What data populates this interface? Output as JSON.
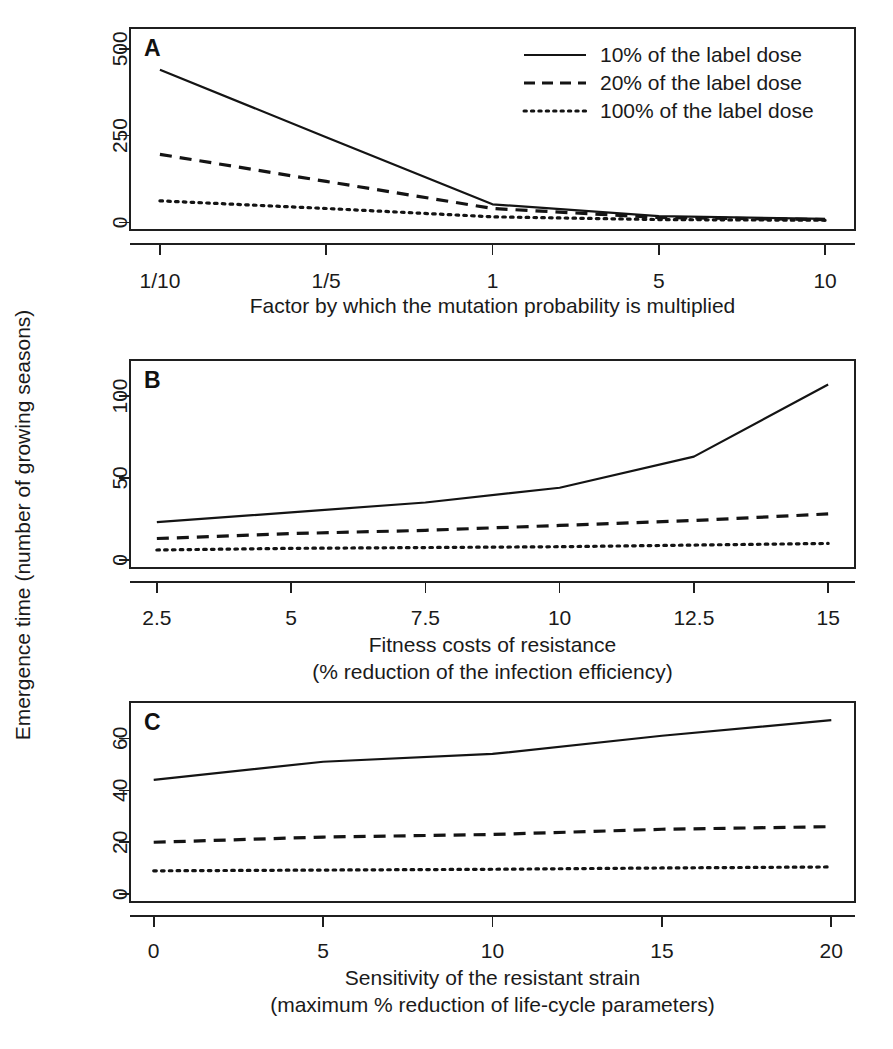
{
  "figure": {
    "shared_ylabel": "Emergence time (number of growing seasons)",
    "legend": {
      "position": "top-right-panel-A",
      "entries": [
        {
          "label": "10% of the label dose",
          "style": "solid"
        },
        {
          "label": "20% of the label dose",
          "style": "dashed"
        },
        {
          "label": "100% of the label dose",
          "style": "dotted"
        }
      ]
    }
  },
  "panels": {
    "a": {
      "letter": "A"
    },
    "b": {
      "letter": "B"
    },
    "c": {
      "letter": "C"
    }
  },
  "chart_data": [
    {
      "id": "panel-a",
      "type": "line",
      "panel_label": "A",
      "title": "",
      "xlabel": "Factor by which the mutation probability is multiplied",
      "ylabel": "Emergence time (number of growing seasons)",
      "categories": [
        "1/10",
        "1/5",
        "1",
        "5",
        "10"
      ],
      "x": [
        0,
        1,
        2,
        3,
        4
      ],
      "xtick_labels": [
        "1/10",
        "1/5",
        "1",
        "5",
        "10"
      ],
      "xtick_values": [
        0,
        1,
        2,
        3,
        4
      ],
      "ytick_labels": [
        "0",
        "250",
        "500"
      ],
      "ytick_values": [
        0,
        250,
        500
      ],
      "ylim": [
        -22,
        560
      ],
      "xlim": [
        -0.18,
        4.18
      ],
      "grid": false,
      "series": [
        {
          "name": "10% of the label dose",
          "style": "solid",
          "values": [
            440,
            245,
            52,
            18,
            10
          ]
        },
        {
          "name": "20% of the label dose",
          "style": "dashed",
          "values": [
            196,
            118,
            40,
            14,
            8
          ]
        },
        {
          "name": "100% of the label dose",
          "style": "dotted",
          "values": [
            62,
            40,
            16,
            8,
            6
          ]
        }
      ]
    },
    {
      "id": "panel-b",
      "type": "line",
      "panel_label": "B",
      "title": "",
      "xlabel": "Fitness costs of resistance",
      "xlabel_line2": "(% reduction of the infection efficiency)",
      "ylabel": "Emergence time (number of growing seasons)",
      "x": [
        2.5,
        5,
        7.5,
        10,
        12.5,
        15
      ],
      "xtick_labels": [
        "2.5",
        "5",
        "7.5",
        "10",
        "12.5",
        "15"
      ],
      "xtick_values": [
        2.5,
        5,
        7.5,
        10,
        12.5,
        15
      ],
      "ytick_labels": [
        "0",
        "50",
        "100"
      ],
      "ytick_values": [
        0,
        50,
        100
      ],
      "ylim": [
        -5,
        122
      ],
      "xlim": [
        2.0,
        15.5
      ],
      "grid": false,
      "series": [
        {
          "name": "10% of the label dose",
          "style": "solid",
          "values": [
            23,
            29,
            35,
            44,
            63,
            107
          ]
        },
        {
          "name": "20% of the label dose",
          "style": "dashed",
          "values": [
            13,
            16,
            18,
            21,
            24,
            28
          ]
        },
        {
          "name": "100% of the label dose",
          "style": "dotted",
          "values": [
            6,
            7,
            7.5,
            8,
            9,
            10
          ]
        }
      ]
    },
    {
      "id": "panel-c",
      "type": "line",
      "panel_label": "C",
      "title": "",
      "xlabel": "Sensitivity of the resistant strain",
      "xlabel_line2": "(maximum % reduction of life-cycle parameters)",
      "ylabel": "Emergence time (number of growing seasons)",
      "x": [
        0,
        5,
        10,
        15,
        20
      ],
      "xtick_labels": [
        "0",
        "5",
        "10",
        "15",
        "20"
      ],
      "xtick_values": [
        0,
        5,
        10,
        15,
        20
      ],
      "ytick_labels": [
        "0",
        "20",
        "40",
        "60"
      ],
      "ytick_values": [
        0,
        20,
        40,
        60
      ],
      "ylim": [
        -3,
        74
      ],
      "xlim": [
        -0.7,
        20.7
      ],
      "grid": false,
      "series": [
        {
          "name": "10% of the label dose",
          "style": "solid",
          "values": [
            44,
            51,
            54,
            61,
            67
          ]
        },
        {
          "name": "20% of the label dose",
          "style": "dashed",
          "values": [
            20,
            22,
            23,
            25,
            26
          ]
        },
        {
          "name": "100% of the label dose",
          "style": "dotted",
          "values": [
            9,
            9.3,
            9.6,
            10.1,
            10.5
          ]
        }
      ]
    }
  ]
}
